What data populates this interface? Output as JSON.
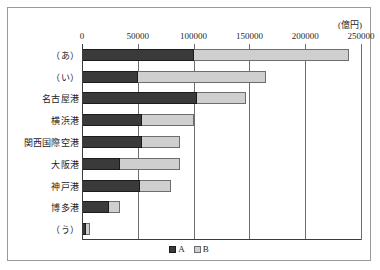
{
  "figure": {
    "unit_label": "(億円)"
  },
  "legend": {
    "position": "bottom-center",
    "items": [
      {
        "name": "A",
        "label": "A",
        "color": "#3a3a3a"
      },
      {
        "name": "B",
        "label": "B",
        "color": "#cfcfcf"
      }
    ]
  },
  "chart_data": {
    "type": "bar",
    "orientation": "horizontal",
    "stacked": true,
    "title": "",
    "subtitle": "",
    "xlabel": "",
    "ylabel": "",
    "unit": "億円",
    "xlim": [
      0,
      250000
    ],
    "xticks": [
      0,
      50000,
      100000,
      150000,
      200000,
      250000
    ],
    "xtick_labels": [
      "0",
      "50000",
      "100000",
      "150000",
      "200000",
      "250000"
    ],
    "grid": true,
    "grid_axis": "x",
    "legend_entries": [
      "A",
      "B"
    ],
    "categories": [
      "（あ）",
      "（い）",
      "名古屋港",
      "横浜港",
      "関西国際空港",
      "大阪港",
      "神戸港",
      "博多港",
      "（う）"
    ],
    "series": [
      {
        "name": "A",
        "color": "#3a3a3a",
        "values": [
          100000,
          50000,
          103000,
          54000,
          54000,
          34000,
          52000,
          24000,
          4000
        ]
      },
      {
        "name": "B",
        "color": "#cfcfcf",
        "values": [
          139000,
          115000,
          44000,
          46000,
          34000,
          54000,
          28000,
          10000,
          3500
        ]
      }
    ],
    "totals": [
      239000,
      165000,
      147000,
      100000,
      88000,
      88000,
      80000,
      34000,
      7500
    ]
  }
}
